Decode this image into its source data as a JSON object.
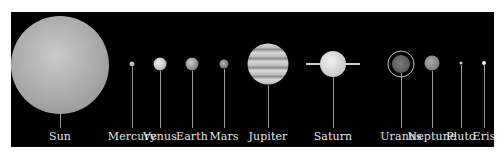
{
  "diagram": {
    "background": "#000000",
    "label_color": "#e6e6e6",
    "bodies": [
      {
        "name": "Sun",
        "x": 49,
        "y": 53,
        "d": 98,
        "fill": "radial-gradient(circle at 45% 40%, #c9c9c9 0%, #a9a9a9 55%, #8a8a8a 100%)"
      },
      {
        "name": "Mercury",
        "x": 121,
        "y": 52,
        "d": 5,
        "fill": "radial-gradient(circle at 40% 40%, #d0d0d0, #8c8c8c)"
      },
      {
        "name": "Venus",
        "x": 149,
        "y": 52,
        "d": 13,
        "fill": "radial-gradient(circle at 40% 40%, #ededed, #a5a5a5)"
      },
      {
        "name": "Earth",
        "x": 181,
        "y": 52,
        "d": 13,
        "fill": "radial-gradient(circle at 40% 40%, #cfcfcf, #5a5a5a)"
      },
      {
        "name": "Mars",
        "x": 213,
        "y": 52,
        "d": 9,
        "fill": "radial-gradient(circle at 40% 40%, #b5b5b5, #555555)"
      },
      {
        "name": "Jupiter",
        "x": 257,
        "y": 52,
        "d": 41,
        "fill": "repeating-linear-gradient(180deg, #d9d9d9 0px, #bdbdbd 4px, #8e8e8e 6px, #d5d5d5 9px)"
      },
      {
        "name": "Saturn",
        "x": 322,
        "y": 52,
        "d": 26,
        "fill": "radial-gradient(circle at 40% 40%, #f0f0f0, #b9b9b9)"
      },
      {
        "name": "Uranus",
        "x": 390,
        "y": 52,
        "d": 18,
        "fill": "radial-gradient(circle at 45% 45%, #7a7a7a, #4a4a4a)"
      },
      {
        "name": "Neptune",
        "x": 421,
        "y": 51,
        "d": 15,
        "fill": "radial-gradient(circle at 40% 40%, #a9a9a9, #6d6d6d)"
      },
      {
        "name": "Pluto",
        "x": 450,
        "y": 51,
        "d": 3,
        "fill": "#cfcfcf"
      },
      {
        "name": "Eris",
        "x": 473,
        "y": 51,
        "d": 4,
        "fill": "#f2f2f2"
      }
    ],
    "saturn_ring": {
      "width": 54
    },
    "uranus_ring": {
      "d": 27
    }
  }
}
